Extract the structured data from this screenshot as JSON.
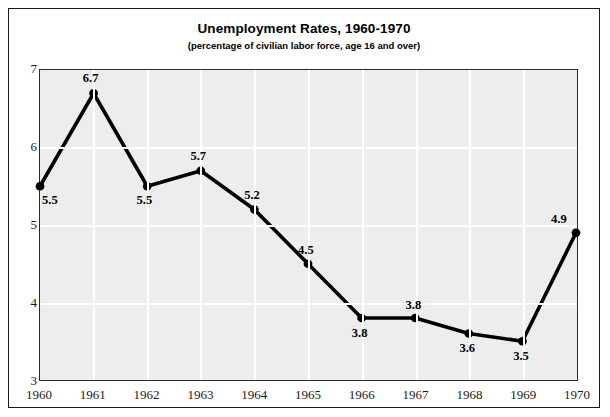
{
  "chart_data": {
    "type": "line",
    "title": "Unemployment Rates, 1960-1970",
    "subtitle": "(percentage of civilian labor force, age 16 and over)",
    "xlabel": "",
    "ylabel": "",
    "categories": [
      "1960",
      "1961",
      "1962",
      "1963",
      "1964",
      "1965",
      "1966",
      "1967",
      "1968",
      "1969",
      "1970"
    ],
    "values": [
      5.5,
      6.7,
      5.5,
      5.7,
      5.2,
      4.5,
      3.8,
      3.8,
      3.6,
      3.5,
      4.9
    ],
    "point_labels": [
      "5.5",
      "6.7",
      "5.5",
      "5.7",
      "5.2",
      "4.5",
      "3.8",
      "3.8",
      "3.6",
      "3.5",
      "4.9"
    ],
    "label_positions": [
      "below-right",
      "above",
      "below",
      "above",
      "above",
      "above",
      "below",
      "above",
      "below",
      "below",
      "above-left"
    ],
    "ylim": [
      3,
      7
    ],
    "yticks": [
      3,
      4,
      5,
      6,
      7
    ],
    "ytick_labels": [
      "3",
      "4",
      "5",
      "6",
      "7"
    ],
    "grid": true,
    "legend": "none",
    "series_color": "#000000",
    "plot_background": "#ededed",
    "gridline_color": "#ffffff",
    "frame_color": "#1a1a1a"
  }
}
